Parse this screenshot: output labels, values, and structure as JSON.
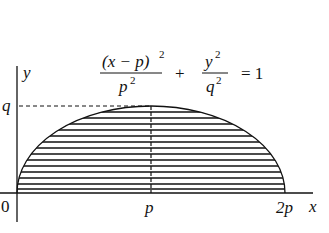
{
  "diagram": {
    "type": "half-ellipse region with horizontal strips",
    "equation": {
      "term1_numerator": "(x − p)",
      "term1_numerator_exp": "2",
      "term1_denominator": "p",
      "term1_denominator_exp": "2",
      "plus": "+",
      "term2_numerator": "y",
      "term2_numerator_exp": "2",
      "term2_denominator": "q",
      "term2_denominator_exp": "2",
      "rhs": "= 1"
    },
    "axes": {
      "x_label": "x",
      "y_label": "y",
      "origin_label": "0",
      "x_ticks": [
        "p",
        "2p"
      ],
      "y_ticks": [
        "q"
      ]
    },
    "colors": {
      "ink": "#111111",
      "background": "#ffffff"
    }
  }
}
